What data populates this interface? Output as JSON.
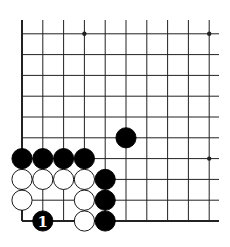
{
  "board": {
    "origin_x": 22,
    "origin_y": 221,
    "spacing": 20.8,
    "cols": 10,
    "rows": 10,
    "line_extend_right": 219,
    "line_extend_top": 20,
    "colors": {
      "line": "#222222",
      "black": "#000000",
      "white": "#ffffff",
      "background": "#ffffff"
    }
  },
  "star_points": [
    {
      "col": 3,
      "row": 9
    },
    {
      "col": 9,
      "row": 9
    },
    {
      "col": 9,
      "row": 3
    }
  ],
  "stones": [
    {
      "color": "black",
      "col": 5,
      "row": 4
    },
    {
      "color": "black",
      "col": 0,
      "row": 3
    },
    {
      "color": "black",
      "col": 1,
      "row": 3
    },
    {
      "color": "black",
      "col": 2,
      "row": 3
    },
    {
      "color": "black",
      "col": 3,
      "row": 3
    },
    {
      "color": "white",
      "col": 0,
      "row": 2
    },
    {
      "color": "white",
      "col": 1,
      "row": 2
    },
    {
      "color": "white",
      "col": 2,
      "row": 2
    },
    {
      "color": "white",
      "col": 3,
      "row": 2
    },
    {
      "color": "black",
      "col": 4,
      "row": 2
    },
    {
      "color": "white",
      "col": 0,
      "row": 1
    },
    {
      "color": "white",
      "col": 3,
      "row": 1
    },
    {
      "color": "black",
      "col": 4,
      "row": 1
    },
    {
      "color": "black",
      "col": 1,
      "row": 0,
      "label": "1"
    },
    {
      "color": "white",
      "col": 3,
      "row": 0
    },
    {
      "color": "black",
      "col": 4,
      "row": 0
    }
  ]
}
